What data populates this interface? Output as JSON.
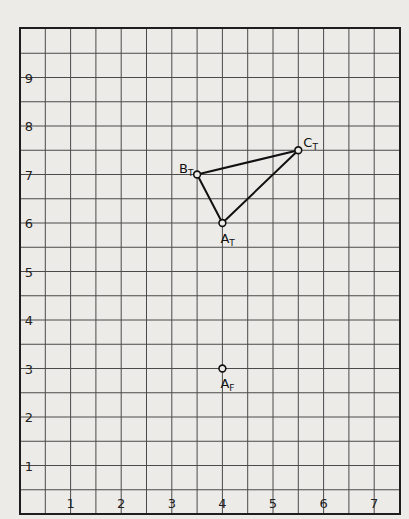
{
  "chart_data": {
    "type": "scatter",
    "title": "",
    "xlabel": "",
    "ylabel": "",
    "xlim": [
      0,
      7.6
    ],
    "ylim": [
      0,
      10
    ],
    "grid": true,
    "grid_minor_step": 0.5,
    "x_ticks": [
      "1",
      "2",
      "3",
      "4",
      "5",
      "6",
      "7"
    ],
    "y_ticks": [
      "1",
      "2",
      "3",
      "4",
      "5",
      "6",
      "7",
      "8",
      "9"
    ],
    "points": [
      {
        "id": "A_T",
        "label": "A",
        "sub": "T",
        "x": 4.0,
        "y": 6.0
      },
      {
        "id": "B_T",
        "label": "B",
        "sub": "T",
        "x": 3.5,
        "y": 7.0
      },
      {
        "id": "C_T",
        "label": "C",
        "sub": "T",
        "x": 5.5,
        "y": 7.5
      },
      {
        "id": "A_F",
        "label": "A",
        "sub": "F",
        "x": 4.0,
        "y": 3.0
      }
    ],
    "polygon": [
      "A_T",
      "B_T",
      "C_T"
    ]
  },
  "colors": {
    "paper": "#ecebe8",
    "grid": "#4a4a4a",
    "frame": "#1e1e1e",
    "ink": "#111111"
  }
}
